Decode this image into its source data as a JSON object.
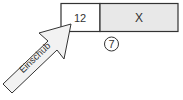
{
  "diagram": {
    "boxes": [
      {
        "label": "12",
        "fill": "#ffffff"
      },
      {
        "label": "X",
        "fill": "#e8e8e8"
      }
    ],
    "circled_number": "7",
    "arrow_label": "Einschub",
    "stroke_color": "#333333"
  }
}
